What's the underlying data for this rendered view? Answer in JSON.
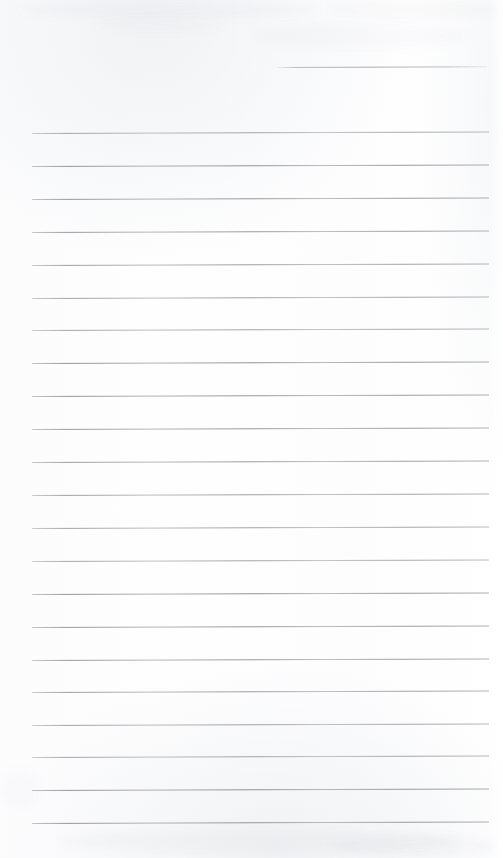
{
  "document": {
    "kind": "scanned-ruled-notebook-page",
    "title": "Blank Ruled Notebook Page",
    "page_width": 503,
    "page_height": 858,
    "background_color": "#fdfdfd",
    "rule_color": "#8e8e92",
    "written_text": "",
    "visible_text_blocks": []
  },
  "ruling": {
    "left_x": 32,
    "right_x": 489,
    "line_thickness": 1,
    "line_spacing": 32.85,
    "first_full_line_y": 133,
    "last_full_line_y": 823,
    "line_count": 22,
    "skew_degrees": -0.18,
    "full_lines_y": [
      133,
      166,
      199,
      232,
      265,
      298,
      330,
      363,
      396,
      429,
      462,
      495,
      528,
      561,
      594,
      627,
      660,
      692,
      725,
      757,
      790,
      823
    ],
    "partial_lines": [
      {
        "name": "header-rule",
        "y": 67,
        "x_start": 277,
        "x_end": 487
      }
    ]
  },
  "scan_artifacts": {
    "smudges": [
      {
        "x": 20,
        "y": 2,
        "w": 300,
        "h": 16,
        "opacity": 0.035
      },
      {
        "x": 330,
        "y": 0,
        "w": 170,
        "h": 20,
        "opacity": 0.03
      },
      {
        "x": 255,
        "y": 22,
        "w": 210,
        "h": 28,
        "opacity": 0.028
      },
      {
        "x": 95,
        "y": 18,
        "w": 130,
        "h": 14,
        "opacity": 0.022
      },
      {
        "x": 60,
        "y": 828,
        "w": 400,
        "h": 26,
        "opacity": 0.04
      },
      {
        "x": 330,
        "y": 836,
        "w": 170,
        "h": 20,
        "opacity": 0.035
      },
      {
        "x": 0,
        "y": 770,
        "w": 40,
        "h": 40,
        "opacity": 0.02
      }
    ]
  }
}
